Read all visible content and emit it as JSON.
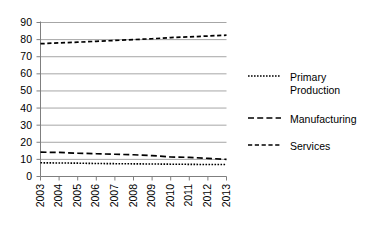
{
  "chart_data": {
    "type": "line",
    "title": "",
    "xlabel": "",
    "ylabel": "",
    "categories": [
      "2003",
      "2004",
      "2005",
      "2006",
      "2007",
      "2008",
      "2009",
      "2010",
      "2011",
      "2012",
      "2013"
    ],
    "x": [
      2003,
      2004,
      2005,
      2006,
      2007,
      2008,
      2009,
      2010,
      2011,
      2012,
      2013
    ],
    "ylim": [
      0,
      90
    ],
    "xlim": [
      2003,
      2013
    ],
    "y_ticks": [
      0,
      10,
      20,
      30,
      40,
      50,
      60,
      70,
      80,
      90
    ],
    "y_tick_labels": [
      "0",
      "10",
      "20",
      "30",
      "40",
      "50",
      "60",
      "70",
      "80",
      "90"
    ],
    "grid": true,
    "grid_axis": "y",
    "grid_color": "#a6a6a6",
    "axis_color": "#808080",
    "legend_position": "right",
    "series": [
      {
        "name": "Primary Production",
        "style": "dotted",
        "color": "#000000",
        "values": [
          8.0,
          7.9,
          7.8,
          7.6,
          7.5,
          7.4,
          7.3,
          7.2,
          7.1,
          7.0,
          7.0
        ]
      },
      {
        "name": "Manufacturing",
        "style": "dashed",
        "color": "#000000",
        "values": [
          14.2,
          14.1,
          13.6,
          13.3,
          13.0,
          12.7,
          12.2,
          11.4,
          11.2,
          10.6,
          10.0
        ]
      },
      {
        "name": "Services",
        "style": "dashed-short",
        "color": "#000000",
        "values": [
          77.6,
          78.1,
          78.5,
          79.0,
          79.5,
          80.0,
          80.5,
          81.2,
          81.6,
          82.1,
          82.6
        ]
      }
    ]
  },
  "legend": {
    "items": [
      {
        "label": "Primary\nProduction",
        "style": "dotted"
      },
      {
        "label": "Manufacturing",
        "style": "dashed"
      },
      {
        "label": "Services",
        "style": "dashed-short"
      }
    ]
  }
}
